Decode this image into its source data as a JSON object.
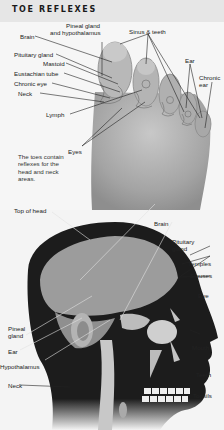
{
  "header": {
    "title": "TOE REFLEXES"
  },
  "toe_diagram": {
    "labels": {
      "pineal_gland": "Pineal gland",
      "hypothalamus": "and hypothalamus",
      "brain": "Brain",
      "pituitary_gland": "Pituitary gland",
      "mastoid": "Mastoid",
      "eustachian_tube": "Eustachian tube",
      "chronic_eye": "Chronic eye",
      "neck": "Neck",
      "lymph": "Lymph",
      "eyes": "Eyes",
      "sinus_teeth": "Sinus & teeth",
      "ear": "Ear",
      "chronic_ear_1": "Chronic",
      "chronic_ear_2": "ear"
    },
    "note": "The toes contain reflexes for the head and neck areas."
  },
  "head_diagram": {
    "labels": {
      "top_of_head": "Top of head",
      "brain": "Brain",
      "pituitary_1": "Pituitary",
      "pituitary_2": "gland",
      "temples": "Temples",
      "sinuses": "Sinuses",
      "eye": "Eye",
      "pineal_1": "Pineal",
      "pineal_2": "gland",
      "ear": "Ear",
      "hypothalamus": "Hypothalamus",
      "neck": "Neck",
      "mouth": "Mouth",
      "teeth": "Teeth",
      "tonsils": "Tonsils"
    }
  },
  "colors": {
    "header_bg": "#e6e6e6",
    "foot_gray": "#9a9a9a",
    "head_silhouette": "#1c1c1c",
    "brain_gray": "#9c9c9c"
  }
}
